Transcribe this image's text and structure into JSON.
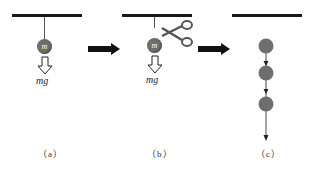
{
  "panels": [
    {
      "caption": "（a）",
      "ball_label": "m",
      "force_label": "mg"
    },
    {
      "caption": "（b）",
      "ball_label": "m",
      "force_label": "mg",
      "tool": "scissors-icon"
    },
    {
      "caption": "（c）",
      "ball_count": 3
    }
  ],
  "colors": {
    "ceiling": "#1a1a1a",
    "ball": "#6e6e6e",
    "arrow": "#111111"
  }
}
